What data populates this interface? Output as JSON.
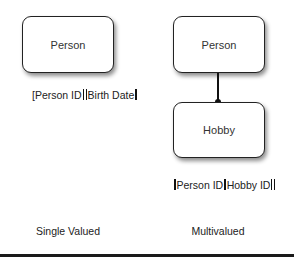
{
  "single_valued": {
    "entity": "Person",
    "fields": [
      "Person ID",
      "Birth Date"
    ],
    "caption": "Single Valued"
  },
  "multivalued": {
    "parent_entity": "Person",
    "child_entity": "Hobby",
    "fields": [
      "Person ID",
      "Hobby ID"
    ],
    "caption": "Multivalued"
  },
  "colors": {
    "line": "#111111",
    "box_border": "#222222",
    "background": "#ffffff"
  }
}
